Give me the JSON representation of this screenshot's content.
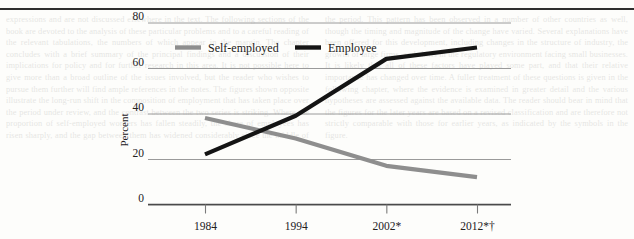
{
  "page": {
    "top_rule": true,
    "ghost_text": "expressions and are not discussed elsewhere in the text. The following sections of the book are devoted to the analysis of these particular problems and to a careful reading of the relevant tabulations, the numbers of which appear in the margin. The chapter concludes with a brief summary of the principal findings and a discussion of their implications for policy and for further research in this area. It is not possible here to give more than a broad outline of the issues involved, but the reader who wishes to pursue them further will find ample references in the notes. The figures shown opposite illustrate the long-run shift in the composition of employment that has taken place over the period under review, and the contrast between the two series is striking. Where the proportion of self-employed workers has fallen steadily, the share of employees has risen sharply, and the gap between them has widened considerably since the middle of the period. This pattern has been observed in a number of other countries as well, though the timing and magnitude of the change have varied. Several explanations have been offered for this development, including changes in the structure of industry, the growth of large firms, and shifts in the regulatory environment facing small businesses. It is likely that all of these factors have played some part, and that their relative importance has changed over time. A fuller treatment of these questions is given in the following chapter, where the evidence is examined in greater detail and the various hypotheses are assessed against the available data. The reader should bear in mind that the figures for the later years are based on a revised classification and are therefore not strictly comparable with those for earlier years, as indicated by the symbols in the figure.",
    "note_symbols": [
      "*",
      "†"
    ]
  },
  "chart_data": {
    "type": "line",
    "title": "",
    "xlabel": "",
    "ylabel": "Percent",
    "categories": [
      "1984",
      "1994",
      "2002*",
      "2012*†"
    ],
    "xtick_labels": [
      "1984",
      "1994",
      "2002*",
      "2012*†"
    ],
    "ytick_labels": [
      "0",
      "20",
      "40",
      "60",
      "80"
    ],
    "yticks": [
      0,
      20,
      40,
      60,
      80
    ],
    "ylim": [
      0,
      85
    ],
    "grid": "horizontal",
    "legend_position": "top-left-inside",
    "series": [
      {
        "name": "Self-employed",
        "color": "#8e8e8e",
        "values": [
          38,
          29,
          17,
          12
        ]
      },
      {
        "name": "Employee",
        "color": "#141414",
        "values": [
          22,
          39,
          64,
          69
        ]
      }
    ]
  }
}
